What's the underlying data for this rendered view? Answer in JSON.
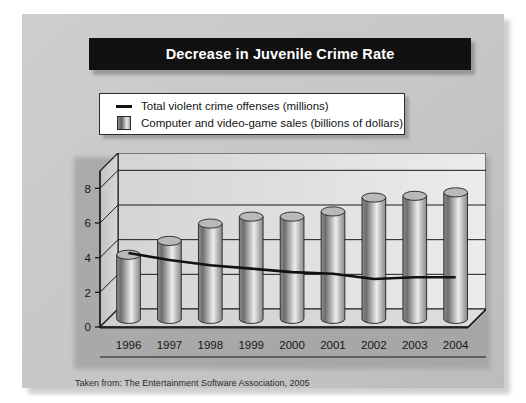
{
  "slide": {
    "title": "Decrease in Juvenile Crime Rate",
    "caption": "Taken from: The Entertainment Software Association, 2005"
  },
  "legend": {
    "items": [
      {
        "key": "line",
        "label": "Total violent crime offenses (millions)"
      },
      {
        "key": "swatch",
        "label": "Computer and video-game sales (billions of dollars)"
      }
    ]
  },
  "colors": {
    "title_background": "#111111",
    "title_text": "#ffffff",
    "panel_background": "#c9c9c9",
    "legend_background": "#ffffff",
    "plot_background": "#e2e2e2",
    "line_color": "#111111",
    "bar_light": "#e8e8e8",
    "bar_dark": "#5f5f5f",
    "axis_color": "#1a1a1a"
  },
  "chart_data": {
    "type": "bar",
    "title": "Decrease in Juvenile Crime Rate",
    "xlabel": "",
    "ylabel": "",
    "ylim": [
      0,
      9
    ],
    "yticks": [
      0,
      2,
      4,
      6,
      8
    ],
    "grid": true,
    "legend_position": "above-plot",
    "categories": [
      "1996",
      "1997",
      "1998",
      "1999",
      "2000",
      "2001",
      "2002",
      "2003",
      "2004"
    ],
    "series": [
      {
        "name": "Computer and video-game sales (billions of dollars)",
        "type": "bar",
        "values": [
          3.7,
          4.5,
          5.5,
          5.9,
          5.9,
          6.2,
          7.0,
          7.1,
          7.3
        ]
      },
      {
        "name": "Total violent crime offenses (millions)",
        "type": "line",
        "values": [
          3.8,
          3.4,
          3.1,
          2.9,
          2.7,
          2.6,
          2.3,
          2.4,
          2.4
        ]
      }
    ]
  }
}
